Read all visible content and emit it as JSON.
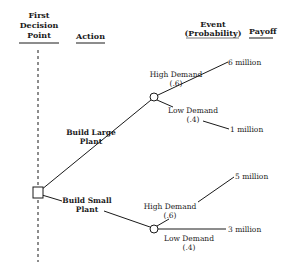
{
  "headers": {
    "decision_point": [
      "First",
      "Decision",
      "Point"
    ],
    "action": "Action",
    "event": [
      "Event",
      "(Probability)"
    ],
    "payoff": "Payoff"
  },
  "actions": [
    {
      "label": [
        "Build Large",
        "Plant"
      ]
    },
    {
      "label": [
        "Build Small",
        "Plant"
      ]
    }
  ],
  "events": {
    "large": [
      {
        "label": "High Demand",
        "prob": "(.6)",
        "payoff": "6 million"
      },
      {
        "label": "Low Demand",
        "prob": "(.4)",
        "payoff": "1 million"
      }
    ],
    "small": [
      {
        "label": "High Demand",
        "prob": "(.6)",
        "payoff": "5 million"
      },
      {
        "label": "Low Demand",
        "prob": "(.4)",
        "payoff": "3 million"
      }
    ]
  },
  "colors": {
    "ink": "#1a1a1a",
    "background": "#ffffff"
  }
}
